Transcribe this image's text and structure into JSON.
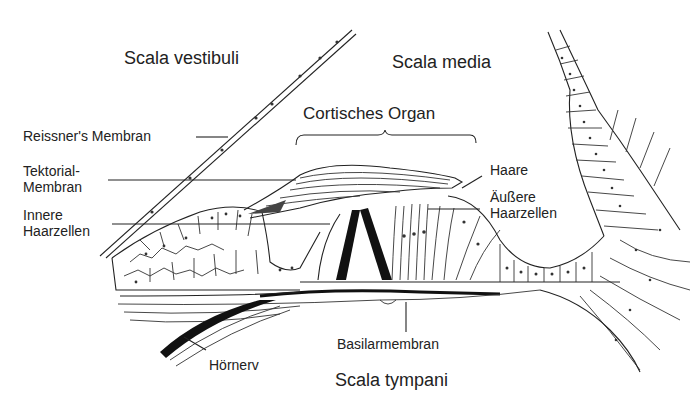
{
  "diagram": {
    "title": "Cortisches Organ",
    "regions": {
      "scala_vestibuli": "Scala vestibuli",
      "scala_media": "Scala media",
      "scala_tympani": "Scala tympani"
    },
    "labels": {
      "reissner": "Reissner's Membran",
      "tektorial_1": "Tektorial-",
      "tektorial_2": "Membran",
      "innere_1": "Innere",
      "innere_2": "Haarzellen",
      "haare": "Haare",
      "aeussere_1": "Äußere",
      "aeussere_2": "Haarzellen",
      "basilar": "Basilarmembran",
      "hoernerv": "Hörnerv"
    },
    "colors": {
      "ink": "#222222",
      "background": "#ffffff"
    }
  }
}
